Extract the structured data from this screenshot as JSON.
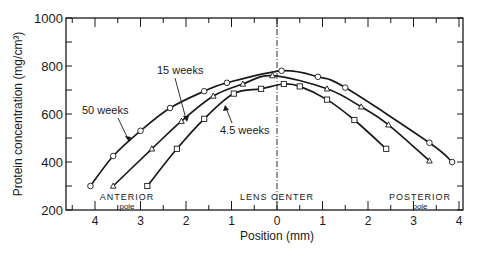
{
  "chart_data": {
    "type": "line",
    "title": "",
    "xlabel": "Position (mm)",
    "ylabel": "Protein concentration (mg/cm3)",
    "xlim": [
      -4.3,
      4.1
    ],
    "ylim": [
      200,
      1000
    ],
    "x_tick_labels": [
      "4",
      "3",
      "2",
      "1",
      "0",
      "1",
      "2",
      "3",
      "4"
    ],
    "x_tick_values": [
      -4,
      -3,
      -2,
      -1,
      0,
      1,
      2,
      3,
      4
    ],
    "y_tick_labels": [
      "200",
      "400",
      "600",
      "800",
      "1000"
    ],
    "y_tick_values": [
      200,
      400,
      600,
      800,
      1000
    ],
    "grid": false,
    "legend": "inline annotations with arrows",
    "annotations": [
      {
        "text": "ANTERIOR",
        "sub": "pole",
        "x": -3.0
      },
      {
        "text": "LENS CENTER",
        "x": 0
      },
      {
        "text": "POSTERIOR",
        "sub": "pole",
        "x": 3.1
      }
    ],
    "series": [
      {
        "name": "50 weeks",
        "marker": "circle",
        "x": [
          -4.1,
          -3.6,
          -3.0,
          -2.35,
          -1.6,
          -1.1,
          0.1,
          0.9,
          1.5,
          3.35,
          3.85
        ],
        "y": [
          300,
          425,
          530,
          625,
          695,
          730,
          780,
          755,
          710,
          480,
          400
        ]
      },
      {
        "name": "15 weeks",
        "marker": "triangle",
        "x": [
          -3.6,
          -2.75,
          -2.1,
          -1.4,
          -0.75,
          -0.1,
          1.1,
          1.85,
          2.45,
          3.35
        ],
        "y": [
          300,
          455,
          570,
          675,
          725,
          760,
          705,
          630,
          555,
          405
        ]
      },
      {
        "name": "4.5 weeks",
        "marker": "square",
        "x": [
          -2.85,
          -2.2,
          -1.6,
          -0.95,
          -0.35,
          0.15,
          0.5,
          1.1,
          1.7,
          2.4
        ],
        "y": [
          300,
          455,
          580,
          685,
          705,
          725,
          715,
          660,
          575,
          455
        ]
      }
    ]
  },
  "labels": {
    "ylabel": "Protein concentration (mg/cm³)",
    "xlabel": "Position (mm)",
    "anterior": "ANTERIOR",
    "anterior_pole": "pole",
    "posterior": "POSTERIOR",
    "posterior_pole": "pole",
    "lens_center": "LENS CENTER",
    "series_50": "50 weeks",
    "series_15": "15 weeks",
    "series_45": "4.5 weeks"
  }
}
